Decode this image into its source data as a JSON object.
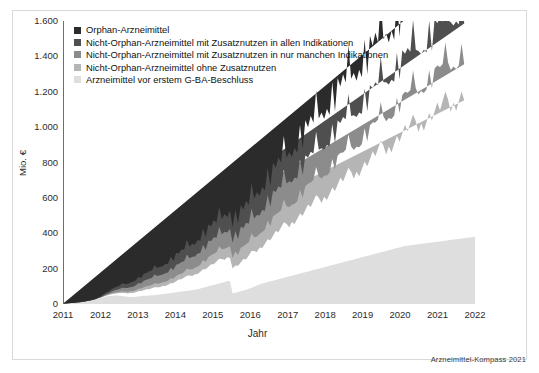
{
  "figure": {
    "credit": "Arzneimittel-Kompass 2021"
  },
  "chart_data": {
    "type": "area",
    "stacked": true,
    "title": "",
    "subtitle": "",
    "xlabel": "Jahr",
    "ylabel": "Mio. €",
    "xlim": [
      2011,
      2022
    ],
    "ylim": [
      0,
      1600
    ],
    "grid": false,
    "legend_position": "top-left",
    "x_tick_labels": [
      "2011",
      "2012",
      "2013",
      "2014",
      "2015",
      "2016",
      "2017",
      "2018",
      "2019",
      "2020",
      "2021",
      "2022"
    ],
    "x_ticks": [
      2011,
      2012,
      2013,
      2014,
      2015,
      2016,
      2017,
      2018,
      2019,
      2020,
      2021,
      2022
    ],
    "y_tick_labels": [
      "0",
      "200",
      "400",
      "600",
      "800",
      "1.000",
      "1.200",
      "1.400",
      "1.600"
    ],
    "y_ticks": [
      0,
      200,
      400,
      600,
      800,
      1000,
      1200,
      1400,
      1600
    ],
    "colors": {
      "orphan": "#2b2b2b",
      "zusatznutzen_alle": "#4f4f4f",
      "zusatznutzen_manche": "#8c8c8c",
      "ohne_zusatznutzen": "#b5b5b5",
      "vor_beschluss": "#dedede"
    },
    "series": [
      {
        "name": "Arzneimittel vor erstem G-BA-Beschluss",
        "color": "#dedede",
        "key": "vor_beschluss",
        "values": [
          2,
          3,
          4,
          5,
          6,
          8,
          10,
          12,
          14,
          17,
          20,
          23,
          26,
          30,
          34,
          38,
          42,
          45,
          47,
          48,
          48,
          47,
          45,
          43,
          41,
          40,
          40,
          41,
          43,
          45,
          46,
          47,
          48,
          49,
          50,
          52,
          54,
          56,
          58,
          60,
          62,
          64,
          66,
          68,
          70,
          72,
          74,
          76,
          78,
          80,
          84,
          88,
          92,
          96,
          100,
          104,
          108,
          112,
          116,
          120,
          124,
          128,
          130,
          60,
          64,
          68,
          72,
          76,
          80,
          86,
          92,
          98,
          104,
          110,
          116,
          120,
          124,
          128,
          132,
          136,
          140,
          144,
          148,
          152,
          156,
          160,
          164,
          168,
          172,
          176,
          180,
          184,
          188,
          192,
          196,
          200,
          204,
          208,
          212,
          216,
          220,
          224,
          228,
          232,
          236,
          240,
          244,
          248,
          252,
          256,
          260,
          264,
          268,
          272,
          276,
          280,
          284,
          288,
          292,
          296,
          300,
          304,
          308,
          312,
          316,
          320,
          324,
          328,
          330,
          332,
          334,
          336,
          338,
          340,
          342,
          344,
          346,
          348,
          350,
          352,
          354,
          356,
          358,
          360,
          362,
          364,
          366,
          368,
          370,
          372,
          374,
          376,
          378,
          380
        ]
      },
      {
        "name": "Nicht-Orphan-Arzneimittel ohne Zusatznutzen",
        "color": "#b5b5b5",
        "key": "ohne_zusatznutzen",
        "values": [
          0,
          0,
          0,
          0,
          0,
          0,
          0,
          0,
          0,
          0,
          0,
          0,
          1,
          2,
          3,
          4,
          5,
          6,
          8,
          10,
          12,
          14,
          16,
          18,
          20,
          22,
          24,
          26,
          28,
          30,
          32,
          34,
          36,
          38,
          40,
          42,
          44,
          46,
          48,
          50,
          54,
          58,
          62,
          66,
          70,
          74,
          78,
          82,
          86,
          90,
          94,
          98,
          102,
          106,
          110,
          114,
          118,
          122,
          126,
          130,
          134,
          138,
          142,
          146,
          150,
          156,
          162,
          168,
          174,
          180,
          188,
          196,
          204,
          212,
          220,
          228,
          236,
          244,
          252,
          260,
          268,
          276,
          284,
          292,
          300,
          308,
          316,
          324,
          332,
          340,
          348,
          356,
          364,
          372,
          380,
          388,
          396,
          404,
          412,
          420,
          428,
          436,
          444,
          452,
          460,
          468,
          476,
          484,
          492,
          500,
          508,
          516,
          524,
          532,
          540,
          548,
          556,
          564,
          572,
          580,
          588,
          596,
          604,
          612,
          620,
          628,
          636,
          644,
          652,
          660,
          668,
          676,
          684,
          692,
          700,
          708,
          716,
          724,
          732,
          740,
          748,
          756,
          764,
          772,
          780,
          788,
          796,
          804,
          812,
          820
        ]
      },
      {
        "name": "Nicht-Orphan-Arzneimittel mit Zusatznutzen in nur manchen Indikationen",
        "color": "#8c8c8c",
        "key": "zusatznutzen_manche",
        "values": [
          0,
          0,
          0,
          0,
          0,
          0,
          0,
          0,
          0,
          0,
          0,
          0,
          0,
          0,
          0,
          1,
          2,
          3,
          4,
          5,
          6,
          7,
          8,
          9,
          10,
          11,
          12,
          13,
          14,
          15,
          16,
          17,
          18,
          19,
          20,
          21,
          22,
          23,
          24,
          25,
          26,
          27,
          28,
          29,
          30,
          32,
          34,
          36,
          38,
          40,
          42,
          44,
          46,
          48,
          50,
          52,
          54,
          56,
          58,
          60,
          62,
          64,
          66,
          68,
          70,
          72,
          74,
          76,
          78,
          80,
          82,
          84,
          86,
          88,
          90,
          92,
          94,
          96,
          98,
          100,
          102,
          104,
          106,
          108,
          110,
          112,
          114,
          116,
          118,
          120,
          122,
          124,
          126,
          128,
          130,
          132,
          134,
          136,
          138,
          140,
          142,
          144,
          146,
          148,
          150,
          152,
          154,
          156,
          158,
          160,
          162,
          164,
          166,
          168,
          170,
          172,
          174,
          176,
          178,
          180,
          182,
          184,
          186,
          188,
          190,
          192,
          194,
          196,
          198,
          200,
          202,
          204,
          206,
          208,
          210,
          212,
          214,
          216,
          218,
          220,
          222,
          224,
          226,
          228,
          230,
          232,
          234,
          236,
          238,
          240
        ]
      },
      {
        "name": "Nicht-Orphan-Arzneimittel mit Zusatznutzen in allen Indikationen",
        "color": "#4f4f4f",
        "key": "zusatznutzen_alle",
        "values": [
          0,
          0,
          0,
          0,
          0,
          0,
          0,
          0,
          0,
          0,
          0,
          0,
          0,
          0,
          2,
          4,
          6,
          8,
          10,
          12,
          14,
          16,
          18,
          20,
          22,
          24,
          26,
          28,
          30,
          32,
          34,
          36,
          38,
          40,
          42,
          44,
          46,
          48,
          50,
          52,
          54,
          56,
          58,
          60,
          62,
          64,
          66,
          68,
          70,
          72,
          74,
          76,
          78,
          80,
          82,
          84,
          86,
          88,
          90,
          92,
          94,
          96,
          98,
          100,
          102,
          104,
          106,
          108,
          110,
          112,
          114,
          116,
          118,
          120,
          122,
          124,
          126,
          128,
          130,
          132,
          134,
          136,
          138,
          140,
          142,
          144,
          146,
          148,
          150,
          152,
          154,
          156,
          158,
          160,
          162,
          164,
          166,
          168,
          170,
          172,
          174,
          176,
          178,
          180,
          182,
          184,
          186,
          188,
          190,
          192,
          194,
          196,
          198,
          200,
          202,
          204,
          206,
          208,
          210,
          212,
          214,
          216,
          218,
          220,
          222,
          224,
          226,
          228,
          230,
          232,
          234,
          236,
          238,
          240,
          242,
          244,
          246,
          248,
          250,
          252,
          254,
          256,
          258,
          260,
          262,
          264,
          266,
          268,
          270,
          272,
          274,
          276,
          278,
          280
        ]
      },
      {
        "name": "Orphan-Arzneimittel",
        "color": "#2b2b2b",
        "key": "orphan",
        "values": [
          0,
          0,
          0,
          0,
          0,
          0,
          0,
          0,
          0,
          0,
          0,
          1,
          2,
          3,
          5,
          7,
          9,
          11,
          13,
          15,
          17,
          19,
          21,
          23,
          25,
          27,
          29,
          31,
          33,
          35,
          37,
          39,
          41,
          43,
          45,
          47,
          49,
          51,
          53,
          55,
          57,
          59,
          61,
          63,
          65,
          67,
          69,
          71,
          73,
          75,
          77,
          79,
          81,
          83,
          85,
          87,
          89,
          91,
          93,
          95,
          97,
          99,
          101,
          103,
          105,
          107,
          109,
          111,
          113,
          115,
          118,
          121,
          124,
          127,
          130,
          133,
          136,
          139,
          142,
          145,
          148,
          151,
          154,
          157,
          160,
          163,
          166,
          169,
          172,
          175,
          178,
          181,
          184,
          187,
          190,
          193,
          196,
          199,
          202,
          205,
          208,
          211,
          214,
          217,
          220,
          223,
          226,
          229,
          232,
          235,
          238,
          241,
          244,
          247,
          250,
          253,
          256,
          259,
          262,
          265,
          268,
          271,
          274,
          277,
          280,
          283,
          286,
          289,
          292,
          295,
          298,
          301,
          304,
          307,
          310,
          313,
          316,
          319,
          322,
          325,
          328,
          331,
          334,
          337,
          340,
          343,
          346,
          349,
          352,
          355
        ]
      }
    ],
    "peak_total_value": 1650,
    "peak_x": 2022,
    "n_points": 150,
    "seasonality": "monthly sawtooth, amplitude grows over time"
  },
  "legend": {
    "items": [
      {
        "label": "Orphan-Arzneimittel",
        "color": "#2b2b2b"
      },
      {
        "label": "Nicht-Orphan-Arzneimittel mit Zusatznutzen in allen Indikationen",
        "color": "#4f4f4f"
      },
      {
        "label": "Nicht-Orphan-Arzneimittel mit Zusatznutzen in nur manchen Indikationen",
        "color": "#8c8c8c"
      },
      {
        "label": "Nicht-Orphan-Arzneimittel ohne Zusatznutzen",
        "color": "#b5b5b5"
      },
      {
        "label": "Arzneimittel vor erstem G-BA-Beschluss",
        "color": "#dedede"
      }
    ]
  }
}
